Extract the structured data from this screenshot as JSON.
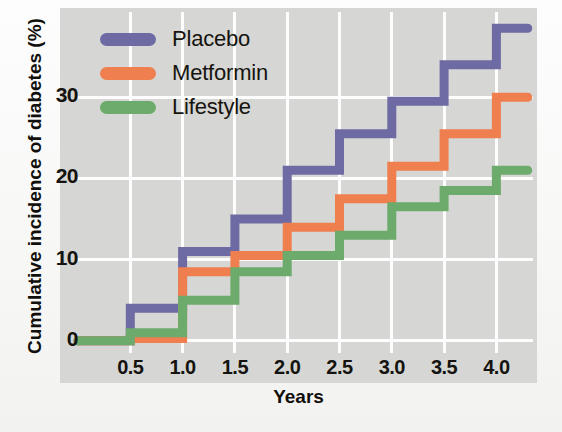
{
  "chart_data": {
    "type": "line",
    "subtype": "step",
    "title": "",
    "xlabel": "Years",
    "ylabel": "Cumulative incidence of diabetes (%)",
    "xlim": [
      0,
      4.35
    ],
    "ylim": [
      -1.5,
      40.5
    ],
    "xticks": [
      0.5,
      1.0,
      1.5,
      2.0,
      2.5,
      3.0,
      3.5,
      4.0
    ],
    "xtick_labels": [
      "0.5",
      "1.0",
      "1.5",
      "2.0",
      "2.5",
      "3.0",
      "3.5",
      "4.0"
    ],
    "yticks": [
      0,
      10,
      20,
      30
    ],
    "ytick_labels": [
      "0",
      "10",
      "20",
      "30"
    ],
    "grid": true,
    "legend_position": "upper-left-inside",
    "panel_color": "#d6d7d4",
    "grid_color": "#fdfdfd",
    "series": [
      {
        "name": "Placebo",
        "color": "#6e6ba4",
        "x": [
          0,
          0.5,
          0.5,
          1.0,
          1.0,
          1.5,
          1.5,
          2.0,
          2.0,
          2.5,
          2.5,
          3.0,
          3.0,
          3.5,
          3.5,
          4.0,
          4.0,
          4.3
        ],
        "y": [
          0,
          0,
          4.0,
          4.0,
          11.0,
          11.0,
          15.0,
          15.0,
          21.0,
          21.0,
          25.5,
          25.5,
          29.5,
          29.5,
          34.0,
          34.0,
          38.5,
          38.5
        ],
        "final_value": 38.5
      },
      {
        "name": "Metformin",
        "color": "#ef7f4f",
        "x": [
          0,
          0.5,
          0.5,
          1.0,
          1.0,
          1.5,
          1.5,
          2.0,
          2.0,
          2.5,
          2.5,
          3.0,
          3.0,
          3.5,
          3.5,
          4.0,
          4.0,
          4.3
        ],
        "y": [
          0,
          0,
          0.3,
          0.3,
          8.5,
          8.5,
          10.5,
          10.5,
          14.0,
          14.0,
          17.5,
          17.5,
          21.5,
          21.5,
          25.5,
          25.5,
          30.0,
          30.0
        ],
        "final_value": 30.0
      },
      {
        "name": "Lifestyle",
        "color": "#6cab6b",
        "x": [
          0,
          0.5,
          0.5,
          1.0,
          1.0,
          1.5,
          1.5,
          2.0,
          2.0,
          2.5,
          2.5,
          3.0,
          3.0,
          3.5,
          3.5,
          4.0,
          4.0,
          4.3
        ],
        "y": [
          0,
          0,
          1.0,
          1.0,
          5.0,
          5.0,
          8.5,
          8.5,
          10.5,
          10.5,
          13.0,
          13.0,
          16.5,
          16.5,
          18.5,
          18.5,
          21.0,
          21.0
        ],
        "final_value": 21.0
      }
    ]
  },
  "legend": {
    "items": [
      {
        "label": "Placebo",
        "color": "#6e6ba4"
      },
      {
        "label": "Metformin",
        "color": "#ef7f4f"
      },
      {
        "label": "Lifestyle",
        "color": "#6cab6b"
      }
    ]
  },
  "axes": {
    "x_title": "Years",
    "y_title": "Cumulative incidence of diabetes (%)"
  }
}
